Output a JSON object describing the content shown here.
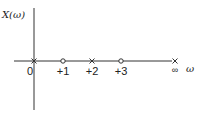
{
  "diagram": {
    "title_label": "X(ω)",
    "axis_label": "ω",
    "markers": [
      {
        "position": "0",
        "type": "pole",
        "symbol": "×",
        "label": "0"
      },
      {
        "position": "+1",
        "type": "zero",
        "symbol": "o",
        "label": "+1"
      },
      {
        "position": "+2",
        "type": "pole",
        "symbol": "×",
        "label": "+2"
      },
      {
        "position": "+3",
        "type": "zero",
        "symbol": "o",
        "label": "+3"
      },
      {
        "position": "∞",
        "type": "pole",
        "symbol": "×",
        "label": "∞"
      }
    ],
    "colors": {
      "ink": "#222222",
      "background": "#ffffff"
    }
  }
}
